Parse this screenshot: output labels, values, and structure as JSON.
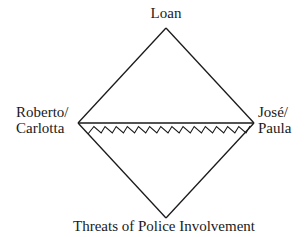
{
  "diagram": {
    "type": "diamond-relationship",
    "nodes": {
      "top": {
        "label": "Loan"
      },
      "left": {
        "label_lines": [
          "Roberto/",
          "Carlotta"
        ]
      },
      "right": {
        "label_lines": [
          "José/",
          "Paula"
        ]
      },
      "bottom": {
        "label": "Threats of Police Involvement"
      }
    },
    "edges": [
      {
        "from": "left",
        "to": "top",
        "style": "solid"
      },
      {
        "from": "top",
        "to": "right",
        "style": "solid"
      },
      {
        "from": "left",
        "to": "right",
        "style": "solid"
      },
      {
        "from": "left",
        "to": "right",
        "style": "zigzag",
        "meaning": "conflict"
      },
      {
        "from": "left",
        "to": "bottom",
        "style": "solid"
      },
      {
        "from": "bottom",
        "to": "right",
        "style": "solid"
      }
    ],
    "colors": {
      "line": "#1a1a1a",
      "text": "#1a1a1a",
      "background": "#ffffff"
    }
  }
}
